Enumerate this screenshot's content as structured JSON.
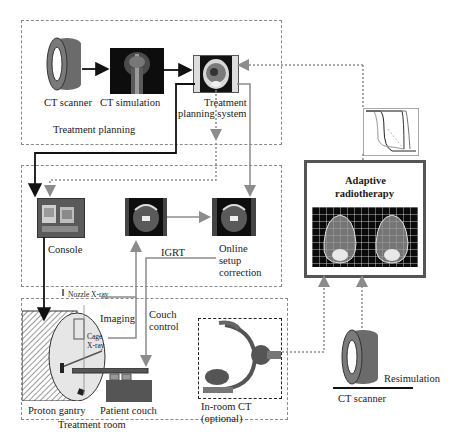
{
  "diagram": {
    "sections": {
      "treatment_planning": "Treatment planning",
      "treatment_room": "Treatment room"
    },
    "nodes": {
      "ct_scanner_top": "CT scanner",
      "ct_simulation": "CT simulation",
      "tps_line1": "Treatment",
      "tps_line2": "planning system",
      "console": "Console",
      "igrt": "IGRT",
      "online_line1": "Online",
      "online_line2": "setup",
      "online_line3": "correction",
      "adaptive_line1": "Adaptive",
      "adaptive_line2": "radiotherapy",
      "proton_gantry": "Proton gantry",
      "patient_couch": "Patient couch",
      "inroom_ct_line1": "In-room CT",
      "inroom_ct_line2": "(optional)",
      "ct_scanner_bottom": "CT scanner",
      "resimulation": "Resimulation"
    },
    "edge_labels": {
      "nozzle_xray": "Nozzle X-ray",
      "cage_xray_line1": "Cage",
      "cage_xray_line2": "X-ray",
      "imaging": "Imaging",
      "couch_control_line1": "Couch",
      "couch_control_line2": "control"
    },
    "colors": {
      "solid_arrow": "#111111",
      "gray_arrow": "#8c8c8c",
      "dotted_arrow": "#8c8c8c",
      "scanner_body": "#6b6b6b",
      "gantry_face": "#e6e6e6"
    }
  }
}
